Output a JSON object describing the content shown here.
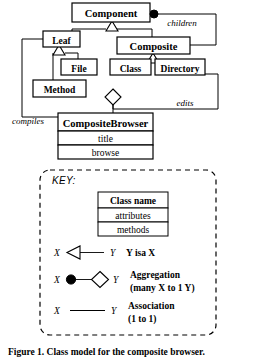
{
  "figure": {
    "caption": "Figure 1.  Class model for the composite browser."
  },
  "classes": {
    "component": {
      "name": "Component"
    },
    "leaf": {
      "name": "Leaf"
    },
    "composite": {
      "name": "Composite"
    },
    "file": {
      "name": "File"
    },
    "class": {
      "name": "Class"
    },
    "directory": {
      "name": "Directory"
    },
    "method": {
      "name": "Method"
    },
    "composite_browser": {
      "name": "CompositeBrowser",
      "attributes": "title",
      "methods": "browse"
    }
  },
  "associations": {
    "children": "children",
    "edits": "edits",
    "compiles": "compiles"
  },
  "key": {
    "title": "KEY:",
    "sample_class": {
      "name": "Class name",
      "attributes": "attributes",
      "methods": "methods"
    },
    "rows": [
      {
        "left_label": "X",
        "right_label": "Y",
        "description": "Y isa X",
        "sub": "",
        "kind": "inheritance"
      },
      {
        "left_label": "X",
        "right_label": "Y",
        "description": "Aggregation",
        "sub": "(many X to 1 Y)",
        "kind": "aggregation"
      },
      {
        "left_label": "X",
        "right_label": "Y",
        "description": "Association",
        "sub": "(1 to 1)",
        "kind": "association"
      }
    ]
  },
  "colors": {
    "ink": "#000000",
    "paper": "#ffffff"
  }
}
